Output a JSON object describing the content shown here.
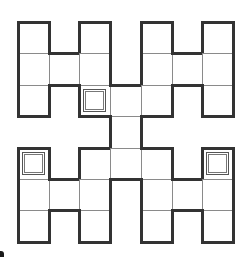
{
  "puzzle": {
    "rows": 7,
    "cols": 7,
    "cell_width": 30.7,
    "cell_height": 31.4,
    "origin": {
      "x": 18,
      "y": 22
    },
    "active_cells": [
      [
        0,
        0
      ],
      [
        0,
        2
      ],
      [
        0,
        4
      ],
      [
        0,
        6
      ],
      [
        1,
        0
      ],
      [
        1,
        1
      ],
      [
        1,
        2
      ],
      [
        1,
        4
      ],
      [
        1,
        5
      ],
      [
        1,
        6
      ],
      [
        2,
        0
      ],
      [
        2,
        2
      ],
      [
        2,
        3
      ],
      [
        2,
        4
      ],
      [
        2,
        6
      ],
      [
        3,
        3
      ],
      [
        4,
        0
      ],
      [
        4,
        2
      ],
      [
        4,
        3
      ],
      [
        4,
        4
      ],
      [
        4,
        6
      ],
      [
        5,
        0
      ],
      [
        5,
        1
      ],
      [
        5,
        2
      ],
      [
        5,
        4
      ],
      [
        5,
        5
      ],
      [
        5,
        6
      ],
      [
        6,
        0
      ],
      [
        6,
        2
      ],
      [
        6,
        4
      ],
      [
        6,
        6
      ]
    ],
    "marked_cells": [
      [
        2,
        2
      ],
      [
        4,
        0
      ],
      [
        4,
        6
      ]
    ],
    "colors": {
      "thin_line": "#8a8a8a",
      "thick_line": "#333333",
      "background": "#ffffff"
    }
  }
}
